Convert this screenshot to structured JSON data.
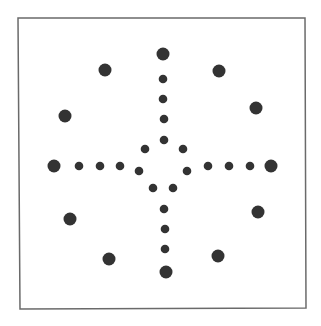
{
  "board": {
    "background": "#ffffff",
    "border_color": "#6a6a6a",
    "border_width": 1.5,
    "frame": {
      "x1": 18,
      "y1": 18,
      "x2": 305,
      "y2": 18,
      "x3": 306,
      "y3": 308,
      "x4": 20,
      "y4": 309
    },
    "dot_color": "#333333",
    "large_radius": 6.5,
    "small_radius": 4.3,
    "holes": [
      {
        "id": "top-end",
        "x": 163,
        "y": 54,
        "size": "large"
      },
      {
        "id": "top-arm-1",
        "x": 163,
        "y": 79,
        "size": "small"
      },
      {
        "id": "top-arm-2",
        "x": 163,
        "y": 99,
        "size": "small"
      },
      {
        "id": "top-arm-3",
        "x": 164,
        "y": 119,
        "size": "small"
      },
      {
        "id": "center-top",
        "x": 164,
        "y": 140,
        "size": "small"
      },
      {
        "id": "center-upper-left",
        "x": 145,
        "y": 149,
        "size": "small"
      },
      {
        "id": "center-upper-right",
        "x": 183,
        "y": 149,
        "size": "small"
      },
      {
        "id": "center-left",
        "x": 139,
        "y": 171,
        "size": "small"
      },
      {
        "id": "center-right",
        "x": 187,
        "y": 171,
        "size": "small"
      },
      {
        "id": "center-lower-left",
        "x": 153,
        "y": 188,
        "size": "small"
      },
      {
        "id": "center-lower-right",
        "x": 173,
        "y": 188,
        "size": "small"
      },
      {
        "id": "left-end",
        "x": 54,
        "y": 166,
        "size": "large"
      },
      {
        "id": "left-arm-1",
        "x": 79,
        "y": 166,
        "size": "small"
      },
      {
        "id": "left-arm-2",
        "x": 100,
        "y": 166,
        "size": "small"
      },
      {
        "id": "left-arm-3",
        "x": 120,
        "y": 166,
        "size": "small"
      },
      {
        "id": "right-arm-1",
        "x": 208,
        "y": 166,
        "size": "small"
      },
      {
        "id": "right-arm-2",
        "x": 229,
        "y": 166,
        "size": "small"
      },
      {
        "id": "right-arm-3",
        "x": 250,
        "y": 166,
        "size": "small"
      },
      {
        "id": "right-end",
        "x": 271,
        "y": 166,
        "size": "large"
      },
      {
        "id": "bottom-arm-1",
        "x": 164,
        "y": 209,
        "size": "small"
      },
      {
        "id": "bottom-arm-2",
        "x": 165,
        "y": 229,
        "size": "small"
      },
      {
        "id": "bottom-arm-3",
        "x": 165,
        "y": 249,
        "size": "small"
      },
      {
        "id": "bottom-end",
        "x": 166,
        "y": 272,
        "size": "large"
      },
      {
        "id": "corner-top-left-a",
        "x": 105,
        "y": 70,
        "size": "large"
      },
      {
        "id": "corner-top-left-b",
        "x": 65,
        "y": 116,
        "size": "large"
      },
      {
        "id": "corner-top-right-a",
        "x": 219,
        "y": 71,
        "size": "large"
      },
      {
        "id": "corner-top-right-b",
        "x": 256,
        "y": 108,
        "size": "large"
      },
      {
        "id": "corner-bottom-left-a",
        "x": 70,
        "y": 219,
        "size": "large"
      },
      {
        "id": "corner-bottom-left-b",
        "x": 109,
        "y": 259,
        "size": "large"
      },
      {
        "id": "corner-bottom-right-a",
        "x": 258,
        "y": 212,
        "size": "large"
      },
      {
        "id": "corner-bottom-right-b",
        "x": 218,
        "y": 256,
        "size": "large"
      }
    ]
  }
}
